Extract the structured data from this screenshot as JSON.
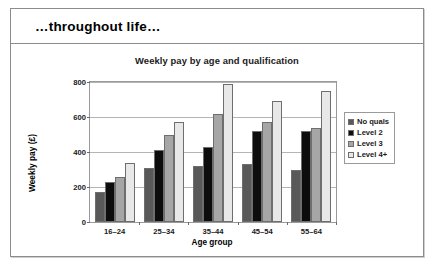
{
  "slide": {
    "header_title": "…throughout life…"
  },
  "chart_data": {
    "type": "bar",
    "title": "Weekly pay by age and qualification",
    "xlabel": "Age group",
    "ylabel": "Weekly pay (£)",
    "categories": [
      "16–24",
      "25–34",
      "35–44",
      "45–54",
      "55–64"
    ],
    "series": [
      {
        "name": "No quals",
        "color": "#595959",
        "values": [
          170,
          310,
          320,
          330,
          300
        ]
      },
      {
        "name": "Level 2",
        "color": "#0d0d0d",
        "values": [
          230,
          410,
          430,
          520,
          520
        ]
      },
      {
        "name": "Level 3",
        "color": "#a6a6a6",
        "values": [
          260,
          500,
          620,
          570,
          540
        ]
      },
      {
        "name": "Level 4+",
        "color": "#e8e8e8",
        "values": [
          340,
          570,
          790,
          690,
          750
        ]
      }
    ],
    "ylim": [
      0,
      800
    ],
    "yticks": [
      0,
      200,
      400,
      600,
      800
    ],
    "ytick_labels": [
      "0",
      "200",
      "400",
      "600",
      "800"
    ],
    "grid": true,
    "legend_position": "right"
  }
}
